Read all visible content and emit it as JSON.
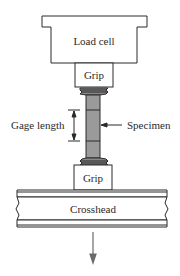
{
  "diagram": {
    "type": "tensile-test-setup",
    "labels": {
      "load_cell": "Load cell",
      "top_grip": "Grip",
      "bottom_grip": "Grip",
      "gage_length": "Gage length",
      "specimen": "Specimen",
      "crosshead": "Crosshead"
    },
    "colors": {
      "line": "#2a2a2a",
      "specimen_fill": "#9a9a9a",
      "background": "#ffffff",
      "arrow": "#6a6a6a"
    },
    "load_direction": "down"
  }
}
